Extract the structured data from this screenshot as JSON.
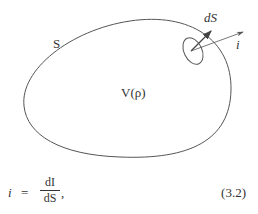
{
  "figure": {
    "region_label": "S",
    "volume_label": "V(ρ)",
    "surface_element_label": "dS",
    "current_density_label": "i",
    "colors": {
      "stroke": "#555555",
      "text": "#333333",
      "background": "#ffffff"
    }
  },
  "equation": {
    "lhs": "i",
    "equals": "=",
    "numerator": "dI",
    "denominator": "dS",
    "trailing": ",",
    "number": "(3.2)"
  }
}
